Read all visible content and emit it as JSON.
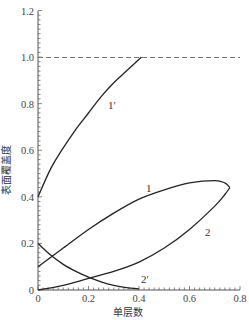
{
  "chart_data": {
    "type": "line",
    "title": "",
    "xlabel": "单层数",
    "ylabel": "表面覆盖度",
    "xlim": [
      0,
      0.8
    ],
    "ylim": [
      0,
      1.2
    ],
    "x_ticks": [
      "0",
      "0.2",
      "0.4",
      "0.6",
      "0.8"
    ],
    "y_ticks": [
      "0",
      "0.2",
      "0.4",
      "0.6",
      "0.8",
      "1.0",
      "1.2"
    ],
    "grid": false,
    "legend": "none (curves labeled inline)",
    "reference_lines": [
      {
        "type": "horizontal",
        "y": 1.0,
        "style": "dashed"
      }
    ],
    "series": [
      {
        "name": "1",
        "label": "1",
        "description": "upper branch of loop",
        "x": [
          0.0,
          0.1,
          0.2,
          0.3,
          0.4,
          0.5,
          0.6,
          0.7,
          0.74,
          0.76
        ],
        "y": [
          0.1,
          0.18,
          0.26,
          0.33,
          0.39,
          0.43,
          0.46,
          0.47,
          0.46,
          0.44
        ]
      },
      {
        "name": "2",
        "label": "2",
        "description": "lower branch of loop",
        "x": [
          0.0,
          0.1,
          0.2,
          0.3,
          0.4,
          0.5,
          0.6,
          0.7,
          0.74,
          0.76
        ],
        "y": [
          0.0,
          0.02,
          0.05,
          0.08,
          0.12,
          0.18,
          0.26,
          0.36,
          0.41,
          0.44
        ]
      },
      {
        "name": "1'",
        "label": "1′",
        "x": [
          0.0,
          0.05,
          0.1,
          0.15,
          0.2,
          0.25,
          0.3,
          0.35,
          0.41
        ],
        "y": [
          0.4,
          0.52,
          0.61,
          0.69,
          0.76,
          0.83,
          0.89,
          0.94,
          1.0
        ]
      },
      {
        "name": "2'",
        "label": "2′",
        "x": [
          0.0,
          0.05,
          0.1,
          0.15,
          0.2,
          0.25,
          0.3,
          0.35,
          0.4
        ],
        "y": [
          0.2,
          0.15,
          0.11,
          0.08,
          0.055,
          0.035,
          0.02,
          0.01,
          0.005
        ]
      }
    ]
  },
  "labels": {
    "xlabel": "单层数",
    "ylabel": "表面覆盖度",
    "curve_1": "1",
    "curve_2": "2",
    "curve_1p": "1′",
    "curve_2p": "2′",
    "xt0": "0",
    "xt1": "0.2",
    "xt2": "0.4",
    "xt3": "0.6",
    "xt4": "0.8",
    "yt0": "0",
    "yt1": "0.2",
    "yt2": "0.4",
    "yt3": "0.6",
    "yt4": "0.8",
    "yt5": "1.0",
    "yt6": "1.2"
  },
  "colors": {
    "line": "#222222",
    "axis": "#555555",
    "dashed": "#777777"
  }
}
